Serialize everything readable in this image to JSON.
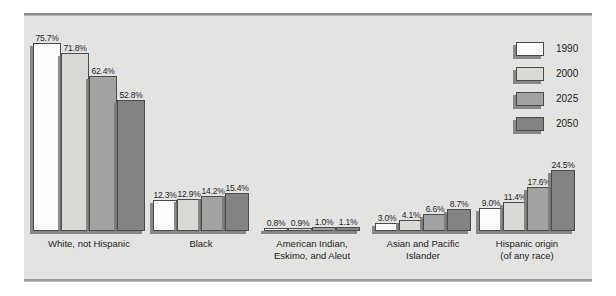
{
  "chart_data": {
    "type": "bar",
    "title": "",
    "xlabel": "",
    "ylabel": "",
    "ylim": [
      0,
      80
    ],
    "grid": false,
    "legend_position": "right",
    "categories": [
      "White, not Hispanic",
      "Black",
      "American Indian,\nEskimo, and Aleut",
      "Asian and Pacific\nIslander",
      "Hispanic origin\n(of any race)"
    ],
    "series": [
      {
        "name": "1990",
        "color": "#fdfdfb",
        "values": [
          75.7,
          12.3,
          0.8,
          3.0,
          9.0
        ]
      },
      {
        "name": "2000",
        "color": "#d9d9d6",
        "values": [
          71.8,
          12.9,
          0.9,
          4.1,
          11.4
        ]
      },
      {
        "name": "2025",
        "color": "#a2a2a0",
        "values": [
          62.4,
          14.2,
          1.0,
          6.6,
          17.6
        ]
      },
      {
        "name": "2050",
        "color": "#838381",
        "values": [
          52.8,
          15.4,
          1.1,
          8.7,
          24.5
        ]
      }
    ],
    "value_labels": [
      [
        "75.7%",
        "71.8%",
        "62.4%",
        "52.8%"
      ],
      [
        "12.3%",
        "12.9%",
        "14.2%",
        "15.4%"
      ],
      [
        "0.8%",
        "0.9%",
        "1.0%",
        "1.1%"
      ],
      [
        "3.0%",
        "4.1%",
        "6.6%",
        "8.7%"
      ],
      [
        "9.0%",
        "11.4%",
        "17.6%",
        "24.5%"
      ]
    ]
  },
  "groups": [
    {
      "label_line1": "White, not Hispanic",
      "label_line2": "",
      "left": 33,
      "bar_width": 28,
      "bars": [
        {
          "value": "75.7%",
          "height": 188
        },
        {
          "value": "71.8%",
          "height": 178
        },
        {
          "value": "62.4%",
          "height": 155
        },
        {
          "value": "52.8%",
          "height": 131
        }
      ]
    },
    {
      "label_line1": "Black",
      "label_line2": "",
      "left": 153,
      "bar_width": 24,
      "bars": [
        {
          "value": "12.3%",
          "height": 31
        },
        {
          "value": "12.9%",
          "height": 32
        },
        {
          "value": "14.2%",
          "height": 35
        },
        {
          "value": "15.4%",
          "height": 38
        }
      ]
    },
    {
      "label_line1": "American Indian,",
      "label_line2": "Eskimo, and Aleut",
      "left": 264,
      "bar_width": 24,
      "bars": [
        {
          "value": "0.8%",
          "height": 3
        },
        {
          "value": "0.9%",
          "height": 3
        },
        {
          "value": "1.0%",
          "height": 4
        },
        {
          "value": "1.1%",
          "height": 4
        }
      ]
    },
    {
      "label_line1": "Asian and Pacific",
      "label_line2": "Islander",
      "left": 375,
      "bar_width": 24,
      "bars": [
        {
          "value": "3.0%",
          "height": 8
        },
        {
          "value": "4.1%",
          "height": 11
        },
        {
          "value": "6.6%",
          "height": 17
        },
        {
          "value": "8.7%",
          "height": 22
        }
      ]
    },
    {
      "label_line1": "Hispanic origin",
      "label_line2": "(of any race)",
      "left": 479,
      "bar_width": 24,
      "bars": [
        {
          "value": "9.0%",
          "height": 23
        },
        {
          "value": "11.4%",
          "height": 29
        },
        {
          "value": "17.6%",
          "height": 44
        },
        {
          "value": "24.5%",
          "height": 61
        }
      ]
    }
  ],
  "legend": {
    "items": [
      {
        "label": "1990"
      },
      {
        "label": "2000"
      },
      {
        "label": "2025"
      },
      {
        "label": "2050"
      }
    ]
  }
}
